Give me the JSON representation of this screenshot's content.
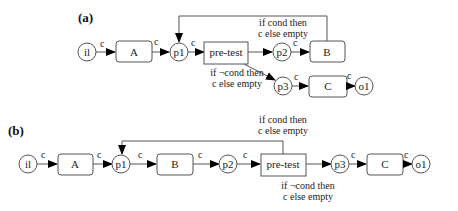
{
  "panels": [
    {
      "label": "(a)",
      "places": [
        "il",
        "p1",
        "p2",
        "p3",
        "o1"
      ],
      "tasks": [
        "A",
        "pre-test",
        "B",
        "C"
      ],
      "arc_label": "c",
      "true_condition": [
        "if cond then",
        "c else empty"
      ],
      "false_condition": [
        "if ¬cond then",
        "c else empty"
      ]
    },
    {
      "label": "(b)",
      "places": [
        "il",
        "p1",
        "p2",
        "p3",
        "o1"
      ],
      "tasks": [
        "A",
        "B",
        "pre-test",
        "C"
      ],
      "arc_label": "c",
      "true_condition": [
        "if cond then",
        "c else empty"
      ],
      "false_condition": [
        "if ¬cond then",
        "c else empty"
      ]
    }
  ],
  "colors": {
    "stroke": "#555555",
    "text": "#222222",
    "arrow": "#000000"
  }
}
